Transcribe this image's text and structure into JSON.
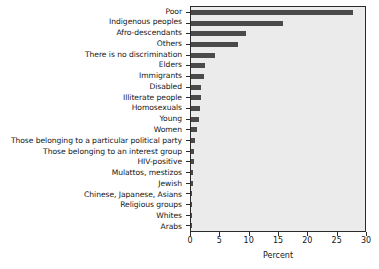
{
  "chart_data": {
    "type": "bar",
    "orientation": "horizontal",
    "title": "",
    "xlabel": "Percent",
    "ylabel": "",
    "xlim": [
      0,
      30
    ],
    "xticks": [
      0,
      5,
      10,
      15,
      20,
      25,
      30
    ],
    "grid": false,
    "legend": null,
    "bar_color": "#4a4a4a",
    "plot_background": "#ebebeb",
    "categories": [
      "Poor",
      "Indigenous peoples",
      "Afro-descendants",
      "Others",
      "There is no discrimination",
      "Elders",
      "Immigrants",
      "Disabled",
      "Illiterate people",
      "Homosexuals",
      "Young",
      "Women",
      "Those belonging to a particular political party",
      "Those belonging to an interest group",
      "HIV-positive",
      "Mulattos, mestizos",
      "Jewish",
      "Chinese, Japanese, Asians",
      "Religious groups",
      "Whites",
      "Arabs"
    ],
    "values": [
      28.0,
      15.9,
      9.4,
      8.1,
      4.1,
      2.4,
      2.2,
      1.8,
      1.7,
      1.5,
      1.3,
      1.0,
      0.7,
      0.6,
      0.5,
      0.3,
      0.3,
      0.2,
      0.2,
      0.1,
      0.1
    ]
  }
}
